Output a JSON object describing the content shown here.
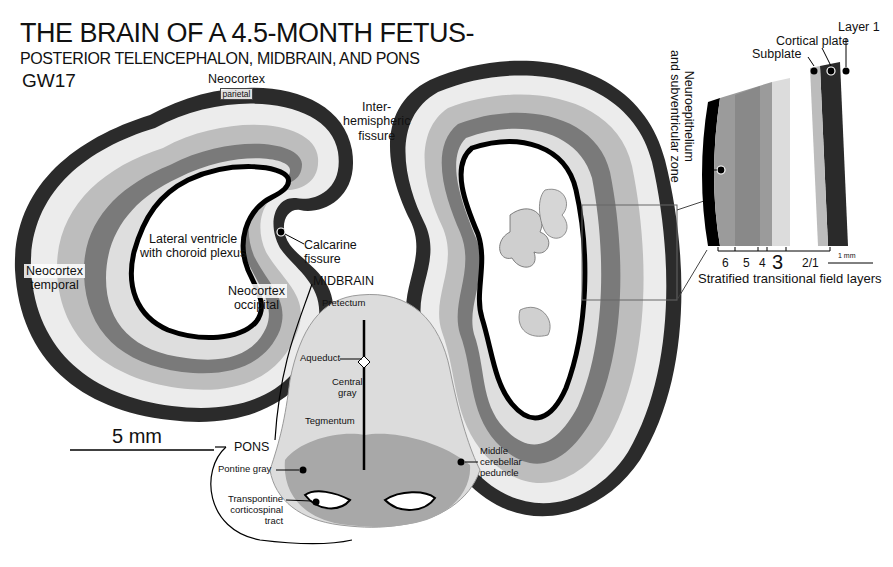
{
  "title": "THE BRAIN OF A 4.5-MONTH FETUS-",
  "subtitle": "POSTERIOR TELENCEPHALON, MIDBRAIN, AND PONS",
  "stage": "GW17",
  "labels": {
    "neocortex_parietal": {
      "name": "Neocortex",
      "sub": "parietal"
    },
    "neocortex_temporal": {
      "name": "Neocortex",
      "sub": "temporal"
    },
    "neocortex_occipital": {
      "name": "Neocortex",
      "sub": "occipital"
    },
    "interhemispheric_fissure": [
      "Inter-",
      "hemispheric",
      "fissure"
    ],
    "lateral_ventricle": [
      "Lateral ventricle",
      "with choroid plexus"
    ],
    "calcarine_fissure": [
      "Calcarine",
      "fissure"
    ],
    "midbrain": "MIDBRAIN",
    "pretectum": "Pretectum",
    "aqueduct": "Aqueduct",
    "central_gray": [
      "Central",
      "gray"
    ],
    "tegmentum": "Tegmentum",
    "pons": "PONS",
    "pontine_gray": "Pontine gray",
    "transpontine_tract": [
      "Transpontine",
      "corticospinal",
      "tract"
    ],
    "middle_cerebellar_peduncle": [
      "Middle",
      "cerebellar",
      "peduncle"
    ]
  },
  "scale_bar": {
    "label": "5 mm"
  },
  "inset": {
    "layer1": "Layer 1",
    "cortical_plate": "Cortical plate",
    "subplate": "Subplate",
    "neuroepithelium": [
      "Neuroepithelium",
      "and subventricular zone"
    ],
    "layer_ticks": [
      "6",
      "5",
      "4",
      "3",
      "2/1"
    ],
    "scale_label": "1 mm",
    "caption": "Stratified transitional field layers"
  },
  "colors": {
    "background": "#ffffff",
    "outer_band": "#2a2a2a",
    "tissue_light": "#e6e6e6",
    "tissue_mid": "#a8a8a8",
    "tissue_dark": "#6e6e6e",
    "ventricle_edge": "#000000"
  }
}
